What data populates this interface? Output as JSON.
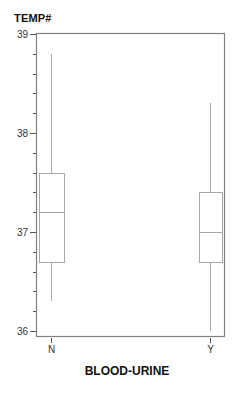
{
  "chart_data": {
    "type": "boxplot",
    "title": "",
    "ylabel": "TEMP#",
    "xlabel": "BLOOD-URINE",
    "categories": [
      "N",
      "Y"
    ],
    "ylim": [
      36,
      39
    ],
    "yticks_major": [
      36,
      37,
      38,
      39
    ],
    "yticks_minor_step": 0.2,
    "grid": false,
    "legend": null,
    "series": [
      {
        "name": "N",
        "whisker_low": 36.3,
        "q1": 36.7,
        "median": 37.2,
        "q3": 37.6,
        "whisker_high": 38.8
      },
      {
        "name": "Y",
        "whisker_low": 36.0,
        "q1": 36.7,
        "median": 37.0,
        "q3": 37.4,
        "whisker_high": 38.3
      }
    ]
  },
  "axes": {
    "y_title": "TEMP#",
    "x_title": "BLOOD-URINE",
    "y_tick_labels": [
      "39",
      "38",
      "37",
      "36"
    ],
    "x_tick_labels": [
      "N",
      "Y"
    ]
  },
  "colors": {
    "frame": "#808080",
    "box": "#a8a8a8",
    "tick": "#555555",
    "text": "#111111"
  }
}
